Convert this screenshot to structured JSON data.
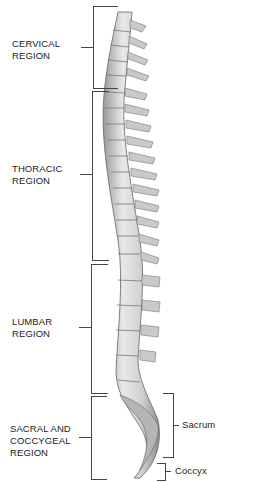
{
  "diagram": {
    "regions": [
      {
        "id": "cervical",
        "label": "CERVICAL\nREGION"
      },
      {
        "id": "thoracic",
        "label": "THORACIC\nREGION"
      },
      {
        "id": "lumbar",
        "label": "LUMBAR\nREGION"
      },
      {
        "id": "sacral",
        "label": "SACRAL AND\nCOCCYGEAL\nREGION"
      }
    ],
    "sub_labels": [
      {
        "id": "sacrum",
        "label": "Sacrum"
      },
      {
        "id": "coccyx",
        "label": "Coccyx"
      }
    ],
    "colors": {
      "line": "#444444",
      "text": "#222222",
      "bone_light": "#e6e6e6",
      "bone_dark": "#8a8a8a"
    }
  }
}
